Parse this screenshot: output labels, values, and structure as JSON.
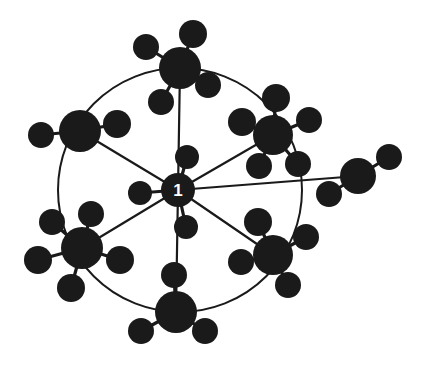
{
  "diagram": {
    "background_color": "#ffffff",
    "node_color": "#1a1a1a",
    "edge_color": "#1a1a1a",
    "label_color": "#ffffff",
    "ring_stroke_width": 2,
    "spoke_stroke_width": 2.2,
    "satellite_stroke_width": 3.2,
    "canvas": {
      "width": 426,
      "height": 375
    }
  },
  "center": {
    "id": "center",
    "label": "1",
    "x": 178,
    "y": 190,
    "r": 17,
    "label_font_size": 17
  },
  "ring": {
    "cx": 180,
    "cy": 190,
    "rx": 122,
    "ry": 122,
    "description": "circle connecting the five primary hubs"
  },
  "hubs": [
    {
      "id": "hub-top",
      "x": 180,
      "y": 68,
      "r": 21
    },
    {
      "id": "hub-upper-right",
      "x": 273,
      "y": 135,
      "r": 20
    },
    {
      "id": "hub-lower-right",
      "x": 273,
      "y": 255,
      "r": 20
    },
    {
      "id": "hub-bottom",
      "x": 176,
      "y": 312,
      "r": 21
    },
    {
      "id": "hub-lower-left",
      "x": 82,
      "y": 248,
      "r": 21
    },
    {
      "id": "hub-upper-left",
      "x": 80,
      "y": 131,
      "r": 21
    },
    {
      "id": "hub-right",
      "x": 358,
      "y": 176,
      "r": 18
    }
  ],
  "center_satellites": [
    {
      "id": "center-sat-top",
      "x": 187,
      "y": 157,
      "r": 12
    },
    {
      "id": "center-sat-left",
      "x": 140,
      "y": 193,
      "r": 12
    },
    {
      "id": "center-sat-bottom",
      "x": 186,
      "y": 227,
      "r": 12
    }
  ],
  "satellites": [
    {
      "id": "sat-top-1",
      "parent": "hub-top",
      "x": 146,
      "y": 47,
      "r": 13
    },
    {
      "id": "sat-top-2",
      "parent": "hub-top",
      "x": 193,
      "y": 34,
      "r": 14
    },
    {
      "id": "sat-top-3",
      "parent": "hub-top",
      "x": 208,
      "y": 85,
      "r": 13
    },
    {
      "id": "sat-top-4",
      "parent": "hub-top",
      "x": 161,
      "y": 102,
      "r": 13
    },
    {
      "id": "sat-ur-1",
      "parent": "hub-upper-right",
      "x": 276,
      "y": 98,
      "r": 14
    },
    {
      "id": "sat-ur-2",
      "parent": "hub-upper-right",
      "x": 309,
      "y": 120,
      "r": 13
    },
    {
      "id": "sat-ur-3",
      "parent": "hub-upper-right",
      "x": 242,
      "y": 122,
      "r": 14
    },
    {
      "id": "sat-ur-4",
      "parent": "hub-upper-right",
      "x": 298,
      "y": 164,
      "r": 13
    },
    {
      "id": "sat-ur-5",
      "parent": "hub-upper-right",
      "x": 259,
      "y": 166,
      "r": 13
    },
    {
      "id": "sat-lr-1",
      "parent": "hub-lower-right",
      "x": 258,
      "y": 222,
      "r": 14
    },
    {
      "id": "sat-lr-2",
      "parent": "hub-lower-right",
      "x": 306,
      "y": 237,
      "r": 13
    },
    {
      "id": "sat-lr-3",
      "parent": "hub-lower-right",
      "x": 241,
      "y": 262,
      "r": 13
    },
    {
      "id": "sat-lr-4",
      "parent": "hub-lower-right",
      "x": 288,
      "y": 285,
      "r": 13
    },
    {
      "id": "sat-bot-1",
      "parent": "hub-bottom",
      "x": 174,
      "y": 275,
      "r": 13
    },
    {
      "id": "sat-bot-2",
      "parent": "hub-bottom",
      "x": 141,
      "y": 331,
      "r": 13
    },
    {
      "id": "sat-bot-3",
      "parent": "hub-bottom",
      "x": 205,
      "y": 331,
      "r": 13
    },
    {
      "id": "sat-ll-1",
      "parent": "hub-lower-left",
      "x": 91,
      "y": 214,
      "r": 13
    },
    {
      "id": "sat-ll-2",
      "parent": "hub-lower-left",
      "x": 52,
      "y": 222,
      "r": 13
    },
    {
      "id": "sat-ll-3",
      "parent": "hub-lower-left",
      "x": 38,
      "y": 260,
      "r": 14
    },
    {
      "id": "sat-ll-4",
      "parent": "hub-lower-left",
      "x": 71,
      "y": 288,
      "r": 14
    },
    {
      "id": "sat-ll-5",
      "parent": "hub-lower-left",
      "x": 120,
      "y": 260,
      "r": 14
    },
    {
      "id": "sat-ul-1",
      "parent": "hub-upper-left",
      "x": 41,
      "y": 135,
      "r": 13
    },
    {
      "id": "sat-ul-2",
      "parent": "hub-upper-left",
      "x": 117,
      "y": 124,
      "r": 14
    },
    {
      "id": "sat-r-1",
      "parent": "hub-right",
      "x": 389,
      "y": 157,
      "r": 13
    },
    {
      "id": "sat-r-2",
      "parent": "hub-right",
      "x": 329,
      "y": 194,
      "r": 13
    }
  ],
  "spokes": [
    {
      "from": "center",
      "to": "hub-top"
    },
    {
      "from": "center",
      "to": "hub-upper-right"
    },
    {
      "from": "center",
      "to": "hub-lower-right"
    },
    {
      "from": "center",
      "to": "hub-bottom"
    },
    {
      "from": "center",
      "to": "hub-lower-left"
    },
    {
      "from": "center",
      "to": "hub-upper-left"
    },
    {
      "from": "center",
      "to": "hub-right"
    }
  ],
  "stats": {
    "hub_count": 7,
    "satellite_count": 26,
    "center_label": "1"
  }
}
